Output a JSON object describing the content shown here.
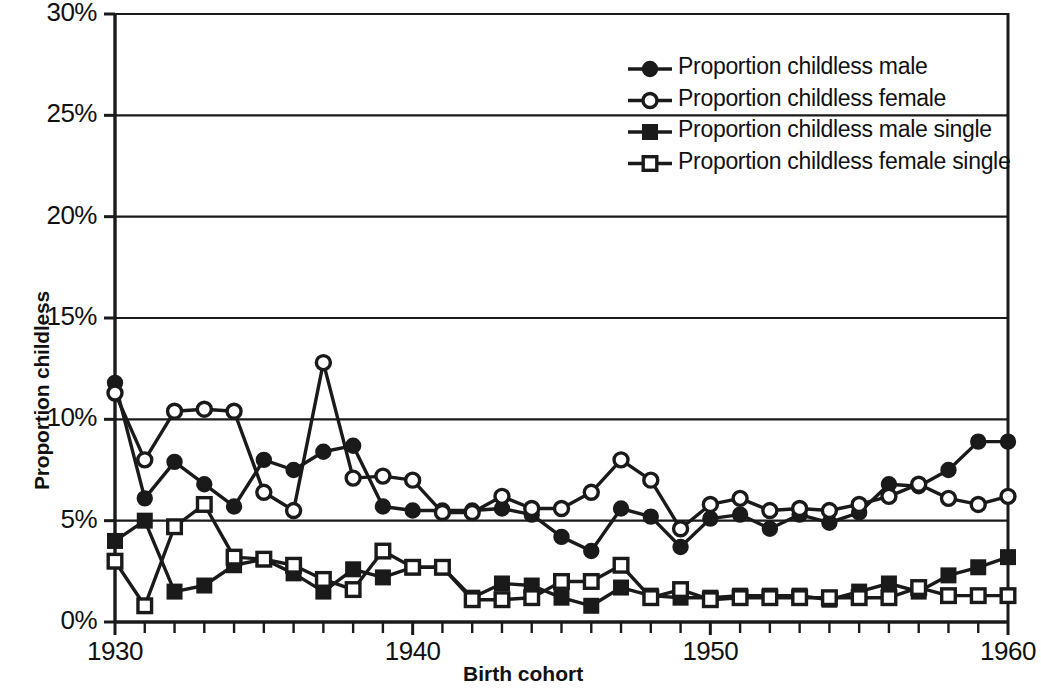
{
  "chart_data": {
    "type": "line",
    "title": "",
    "xlabel": "Birth cohort",
    "ylabel": "Proportion childless",
    "xlim": [
      1930,
      1960
    ],
    "ylim": [
      0,
      30
    ],
    "ytick_values": [
      0,
      5,
      10,
      15,
      20,
      25,
      30
    ],
    "ytick_labels": [
      "0%",
      "5%",
      "10%",
      "15%",
      "20%",
      "25%",
      "30%"
    ],
    "xtick_values": [
      1930,
      1940,
      1950,
      1960
    ],
    "xtick_labels": [
      "1930",
      "1940",
      "1950",
      "1960"
    ],
    "xtick_minor_step": 1,
    "grid": "horizontal",
    "legend_position": "top-right",
    "x": [
      1930,
      1931,
      1932,
      1933,
      1934,
      1935,
      1936,
      1937,
      1938,
      1939,
      1940,
      1941,
      1942,
      1943,
      1944,
      1945,
      1946,
      1947,
      1948,
      1949,
      1950,
      1951,
      1952,
      1953,
      1954,
      1955,
      1956,
      1957,
      1958,
      1959,
      1960
    ],
    "series": [
      {
        "name": "Proportion childless male",
        "marker": "filled-circle",
        "color": "#1a1a1a",
        "values": [
          11.8,
          6.1,
          7.9,
          6.8,
          5.7,
          8.0,
          7.5,
          8.4,
          8.7,
          5.7,
          5.5,
          5.5,
          5.5,
          5.6,
          5.3,
          4.2,
          3.5,
          5.6,
          5.2,
          3.7,
          5.1,
          5.3,
          4.6,
          5.3,
          4.9,
          5.4,
          6.8,
          6.7,
          7.5,
          8.9,
          8.9
        ]
      },
      {
        "name": "Proportion childless female",
        "marker": "open-circle",
        "color": "#1a1a1a",
        "values": [
          11.3,
          8.0,
          10.4,
          10.5,
          10.4,
          6.4,
          5.5,
          12.8,
          7.1,
          7.2,
          7.0,
          5.4,
          5.4,
          6.2,
          5.6,
          5.6,
          6.4,
          8.0,
          7.0,
          4.6,
          5.8,
          6.1,
          5.5,
          5.6,
          5.5,
          5.8,
          6.2,
          6.8,
          6.1,
          5.8,
          6.2
        ]
      },
      {
        "name": "Proportion childless male single",
        "marker": "filled-square",
        "color": "#1a1a1a",
        "values": [
          4.0,
          5.0,
          1.5,
          1.8,
          2.8,
          3.1,
          2.4,
          1.5,
          2.6,
          2.2,
          2.7,
          2.7,
          1.2,
          1.9,
          1.8,
          1.2,
          0.8,
          1.7,
          1.3,
          1.2,
          1.2,
          1.3,
          1.3,
          1.3,
          1.1,
          1.5,
          1.9,
          1.5,
          2.3,
          2.7,
          3.2
        ]
      },
      {
        "name": "Proportion childless female single",
        "marker": "open-square",
        "color": "#1a1a1a",
        "values": [
          3.0,
          0.8,
          4.7,
          5.8,
          3.2,
          3.1,
          2.8,
          2.1,
          1.6,
          3.5,
          2.7,
          2.7,
          1.1,
          1.1,
          1.2,
          2.0,
          2.0,
          2.8,
          1.2,
          1.6,
          1.1,
          1.2,
          1.2,
          1.2,
          1.2,
          1.2,
          1.2,
          1.7,
          1.3,
          1.3,
          1.3
        ]
      }
    ]
  },
  "legend": {
    "items": [
      {
        "label": "Proportion childless male",
        "marker": "filled-circle"
      },
      {
        "label": "Proportion childless female",
        "marker": "open-circle"
      },
      {
        "label": "Proportion childless male single",
        "marker": "filled-square"
      },
      {
        "label": "Proportion childless female single",
        "marker": "open-square"
      }
    ]
  },
  "axes": {
    "y_title": "Proportion childless",
    "x_title": "Birth cohort"
  }
}
